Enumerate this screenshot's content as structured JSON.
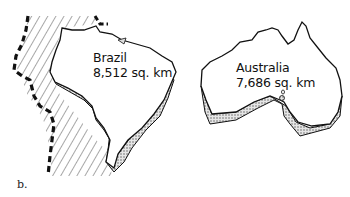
{
  "figure": {
    "caption": "b.",
    "panels": [
      {
        "country": "Brazil",
        "area": "8,512 sq. km"
      },
      {
        "country": "Australia",
        "area": "7,686 sq. km"
      }
    ],
    "colors": {
      "outline": "#111111",
      "stipple": "#bdbdbd",
      "background": "#ffffff"
    }
  }
}
